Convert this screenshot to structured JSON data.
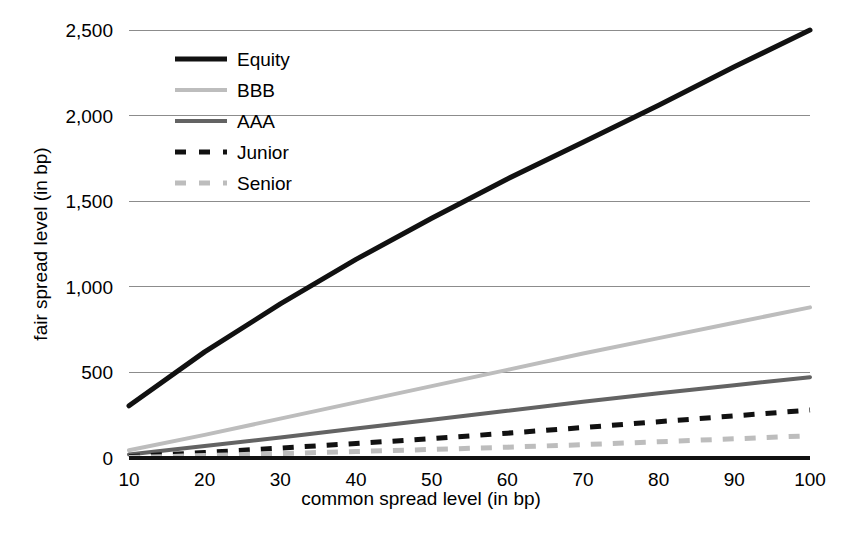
{
  "chart_data": {
    "type": "line",
    "title": "",
    "xlabel": "common spread level (in bp)",
    "ylabel": "fair spread level (in bp)",
    "xlim": [
      10,
      100
    ],
    "ylim": [
      0,
      2500
    ],
    "grid": true,
    "legend_position": "top-left-inside",
    "x_ticks": [
      "10",
      "20",
      "30",
      "40",
      "50",
      "60",
      "70",
      "80",
      "90",
      "100"
    ],
    "y_ticks": [
      "0",
      "500",
      "1,000",
      "1,500",
      "2,000",
      "2,500"
    ],
    "x": [
      10,
      20,
      30,
      40,
      50,
      60,
      70,
      80,
      90,
      100
    ],
    "series": [
      {
        "name": "Equity",
        "color": "#111111",
        "width": 5,
        "dash": "none",
        "values": [
          305,
          620,
          900,
          1160,
          1400,
          1630,
          1845,
          2060,
          2285,
          2500
        ]
      },
      {
        "name": "BBB",
        "color": "#bdbdbd",
        "width": 4,
        "dash": "none",
        "values": [
          45,
          135,
          230,
          325,
          420,
          515,
          610,
          700,
          790,
          880
        ]
      },
      {
        "name": "AAA",
        "color": "#636363",
        "width": 4,
        "dash": "none",
        "values": [
          20,
          70,
          120,
          172,
          224,
          276,
          328,
          378,
          425,
          472
        ]
      },
      {
        "name": "Junior",
        "color": "#111111",
        "width": 5,
        "dash": "dashed",
        "values": [
          8,
          32,
          58,
          85,
          113,
          145,
          178,
          212,
          246,
          280
        ]
      },
      {
        "name": "Senior",
        "color": "#bdbdbd",
        "width": 5,
        "dash": "dashed",
        "values": [
          3,
          14,
          26,
          38,
          50,
          63,
          78,
          95,
          112,
          130
        ]
      }
    ],
    "baseline": {
      "name": "zero-baseline",
      "color": "#111111",
      "width": 4
    }
  },
  "legend": {
    "items": [
      {
        "label": "Equity"
      },
      {
        "label": "BBB"
      },
      {
        "label": "AAA"
      },
      {
        "label": "Junior"
      },
      {
        "label": "Senior"
      }
    ]
  }
}
